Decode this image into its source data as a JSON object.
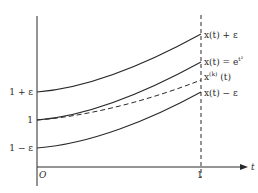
{
  "diagram": {
    "axes": {
      "x_label": "t",
      "origin_label": "O",
      "x_tick_label": "1"
    },
    "y_tick_labels": {
      "upper": "1 + ε",
      "middle": "1",
      "lower": "1 − ε"
    },
    "curve_labels": {
      "upper": "x(t) + ε",
      "exact": "x(t) = e",
      "exact_exp": "t²",
      "approx_base": "x",
      "approx_sup": "(k)",
      "approx_arg": " (t)",
      "lower": "x(t) − ε"
    },
    "colors": {
      "line": "#2a2a2a",
      "background": "#ffffff"
    }
  }
}
